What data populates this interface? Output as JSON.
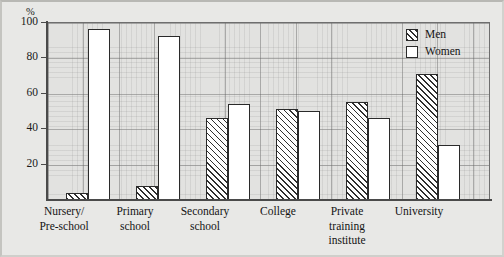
{
  "chart_data": {
    "type": "bar",
    "title": "",
    "xlabel": "",
    "ylabel": "%",
    "ylim": [
      0,
      100
    ],
    "grid": true,
    "legend_position": "top-right",
    "y_ticks": [
      100,
      80,
      60,
      40,
      20
    ],
    "y_tick_labels": [
      "100",
      "80",
      "60",
      "40",
      "20"
    ],
    "categories": [
      "Nursery/ Pre-school",
      "Primary school",
      "Secondary school",
      "College",
      "Private training institute",
      "University"
    ],
    "category_lines": [
      [
        "Nursery/",
        "Pre-school"
      ],
      [
        "Primary",
        "school"
      ],
      [
        "Secondary",
        "school"
      ],
      [
        "College"
      ],
      [
        "Private",
        "training",
        "institute"
      ],
      [
        "University"
      ]
    ],
    "series": [
      {
        "name": "Men",
        "values": [
          4,
          8,
          46,
          51,
          55,
          71
        ]
      },
      {
        "name": "Women",
        "values": [
          96,
          92,
          54,
          50,
          46,
          31
        ]
      }
    ],
    "legend": [
      {
        "label": "Men",
        "style": "hatched"
      },
      {
        "label": "Women",
        "style": "white"
      }
    ]
  },
  "colors": {
    "page_background": "#e8e8e6",
    "plot_background": "#e2e2e0",
    "axis": "#4a4a4a",
    "bar_outline": "#2a2a2a",
    "women_fill": "#ffffff",
    "men_hatch": "#2f2f2f",
    "text": "#141414"
  }
}
